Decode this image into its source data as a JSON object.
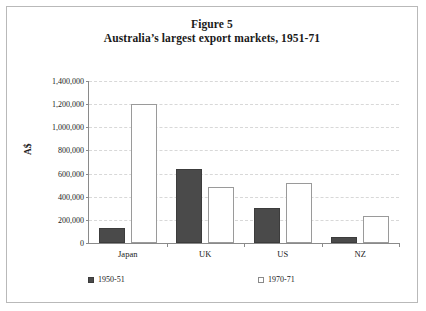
{
  "figure": {
    "title_line1": "Figure 5",
    "title_line2": "Australia’s largest export markets, 1951-71"
  },
  "chart_data": {
    "type": "bar",
    "title": "Australia’s largest export markets, 1951-71",
    "figure_number": "Figure 5",
    "xlabel": "",
    "ylabel": "A$",
    "categories": [
      "Japan",
      "UK",
      "US",
      "NZ"
    ],
    "series": [
      {
        "name": "1950-51",
        "color": "#4a4a4a",
        "values": [
          130000,
          640000,
          300000,
          55000
        ]
      },
      {
        "name": "1970-71",
        "color": "#ffffff",
        "values": [
          1200000,
          480000,
          515000,
          235000
        ]
      }
    ],
    "ylim": [
      0,
      1400000
    ],
    "ytick_values": [
      0,
      200000,
      400000,
      600000,
      800000,
      1000000,
      1200000,
      1400000
    ],
    "ytick_labels": [
      "0",
      "200,000",
      "400,000",
      "600,000",
      "800,000",
      "1,000,000",
      "1,200,000",
      "1,400,000"
    ],
    "grid": true,
    "grid_axis": "y",
    "grid_style": "dashed",
    "grid_color": "#d8d8d8",
    "legend_position": "bottom",
    "legend": [
      {
        "label": "1950-51",
        "marker": "filled-square",
        "color": "#4a4a4a"
      },
      {
        "label": "1970-71",
        "marker": "hollow-square",
        "color": "#ffffff"
      }
    ]
  }
}
